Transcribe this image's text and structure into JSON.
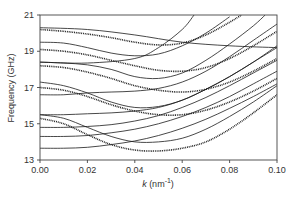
{
  "chart_data": {
    "type": "line",
    "title": "",
    "xlabel": "k (nm⁻¹)",
    "xlabel_italic_part": "k",
    "xlabel_rest": " (nm",
    "xlabel_sup": "-1",
    "xlabel_close": ")",
    "ylabel": "Frequency (GHz)",
    "xlim": [
      0.0,
      0.1
    ],
    "ylim": [
      13,
      21
    ],
    "xticks": [
      "0.00",
      "0.02",
      "0.04",
      "0.06",
      "0.08",
      "0.10"
    ],
    "yticks": [
      "13",
      "15",
      "17",
      "19",
      "21"
    ],
    "grid": false,
    "legend": null,
    "series": [
      {
        "name": "dotted-1",
        "style": "dotted",
        "x": [
          0,
          0.01,
          0.02,
          0.03,
          0.04,
          0.05,
          0.06,
          0.07,
          0.08,
          0.085
        ],
        "y": [
          20.2,
          20.1,
          19.95,
          19.75,
          19.5,
          19.35,
          19.45,
          19.9,
          20.6,
          21.0
        ]
      },
      {
        "name": "dotted-2",
        "style": "dotted",
        "x": [
          0,
          0.01,
          0.02,
          0.03,
          0.04,
          0.05,
          0.06,
          0.07,
          0.08,
          0.09,
          0.1
        ],
        "y": [
          19.1,
          19.0,
          18.8,
          18.5,
          18.2,
          17.95,
          17.9,
          18.1,
          18.6,
          19.3,
          20.1
        ]
      },
      {
        "name": "dotted-3",
        "style": "dotted",
        "x": [
          0,
          0.01,
          0.02,
          0.03,
          0.04,
          0.05,
          0.06,
          0.07,
          0.08,
          0.09,
          0.1
        ],
        "y": [
          18.2,
          18.1,
          17.85,
          17.5,
          17.1,
          16.85,
          16.75,
          16.9,
          17.3,
          17.9,
          18.6
        ]
      },
      {
        "name": "dotted-4",
        "style": "dotted",
        "x": [
          0,
          0.01,
          0.02,
          0.03,
          0.04,
          0.05,
          0.06,
          0.07,
          0.08,
          0.09,
          0.1
        ],
        "y": [
          17.0,
          16.85,
          16.5,
          16.05,
          15.7,
          15.5,
          15.5,
          15.75,
          16.2,
          16.8,
          17.5
        ]
      },
      {
        "name": "dotted-5",
        "style": "dotted",
        "x": [
          0,
          0.01,
          0.02,
          0.03,
          0.04,
          0.05,
          0.06,
          0.07,
          0.08,
          0.09,
          0.1
        ],
        "y": [
          15.3,
          15.0,
          14.4,
          13.85,
          13.55,
          13.5,
          13.65,
          14.0,
          14.7,
          15.6,
          16.6
        ]
      },
      {
        "name": "solid-1",
        "style": "solid",
        "x": [
          0,
          0.02,
          0.04,
          0.06,
          0.08,
          0.1
        ],
        "y": [
          20.3,
          20.2,
          19.9,
          19.5,
          19.3,
          19.2
        ]
      },
      {
        "name": "solid-2",
        "style": "solid",
        "x": [
          0,
          0.01,
          0.02,
          0.03,
          0.04,
          0.05,
          0.06,
          0.07,
          0.08
        ],
        "y": [
          19.5,
          19.45,
          19.2,
          18.9,
          18.75,
          18.85,
          19.3,
          20.0,
          20.9
        ]
      },
      {
        "name": "solid-3",
        "style": "solid",
        "x": [
          0,
          0.02,
          0.04,
          0.05,
          0.06,
          0.065
        ],
        "y": [
          18.4,
          18.35,
          18.6,
          19.2,
          20.2,
          21.0
        ]
      },
      {
        "name": "solid-4",
        "style": "solid",
        "x": [
          0,
          0.01,
          0.02,
          0.03,
          0.04,
          0.05,
          0.06,
          0.07,
          0.08,
          0.09,
          0.095
        ],
        "y": [
          18.4,
          18.35,
          18.25,
          18.0,
          17.6,
          17.5,
          17.8,
          18.5,
          19.4,
          20.4,
          21.0
        ]
      },
      {
        "name": "solid-5",
        "style": "solid",
        "x": [
          0,
          0.01,
          0.02,
          0.03,
          0.04,
          0.05,
          0.06,
          0.07,
          0.08,
          0.09,
          0.1
        ],
        "y": [
          17.3,
          17.1,
          16.7,
          16.2,
          15.9,
          15.95,
          16.3,
          16.9,
          17.6,
          18.4,
          19.3
        ]
      },
      {
        "name": "solid-6",
        "style": "solid",
        "x": [
          0,
          0.01,
          0.02,
          0.03,
          0.04,
          0.05,
          0.06,
          0.07,
          0.08,
          0.09,
          0.1
        ],
        "y": [
          16.6,
          16.6,
          16.7,
          16.75,
          16.8,
          16.95,
          17.3,
          17.9,
          18.7,
          19.6,
          20.5
        ]
      },
      {
        "name": "solid-7",
        "style": "solid",
        "x": [
          0,
          0.01,
          0.02,
          0.03,
          0.04,
          0.05,
          0.06,
          0.07,
          0.08,
          0.09,
          0.1
        ],
        "y": [
          15.5,
          15.5,
          15.55,
          15.6,
          15.7,
          15.9,
          16.3,
          16.9,
          17.6,
          18.4,
          19.2
        ]
      },
      {
        "name": "solid-8",
        "style": "solid",
        "x": [
          0,
          0.01,
          0.02,
          0.03,
          0.04,
          0.05,
          0.06,
          0.07,
          0.08,
          0.09,
          0.1
        ],
        "y": [
          15.5,
          15.3,
          14.8,
          14.3,
          14.0,
          14.0,
          14.2,
          14.7,
          15.4,
          16.2,
          17.1
        ]
      },
      {
        "name": "solid-9",
        "style": "solid",
        "x": [
          0,
          0.01,
          0.02,
          0.03,
          0.04,
          0.05,
          0.06,
          0.07,
          0.08,
          0.09,
          0.1
        ],
        "y": [
          14.8,
          14.8,
          14.85,
          14.95,
          15.15,
          15.45,
          15.9,
          16.45,
          17.1,
          17.8,
          18.5
        ]
      },
      {
        "name": "solid-10",
        "style": "solid",
        "x": [
          0,
          0.01,
          0.02,
          0.03,
          0.04,
          0.05,
          0.06,
          0.07,
          0.08,
          0.09,
          0.1
        ],
        "y": [
          14.3,
          14.3,
          14.35,
          14.5,
          14.7,
          15.0,
          15.4,
          15.9,
          16.5,
          17.2,
          17.9
        ]
      },
      {
        "name": "solid-11",
        "style": "solid",
        "x": [
          0,
          0.01,
          0.02,
          0.03,
          0.04,
          0.05,
          0.06,
          0.07,
          0.08,
          0.09,
          0.1
        ],
        "y": [
          13.65,
          13.65,
          13.7,
          13.85,
          14.05,
          14.35,
          14.75,
          15.25,
          15.85,
          16.5,
          17.2
        ]
      }
    ]
  },
  "colors": {
    "line": "#1a1a1a",
    "axis": "#444444",
    "background": "#ffffff"
  }
}
